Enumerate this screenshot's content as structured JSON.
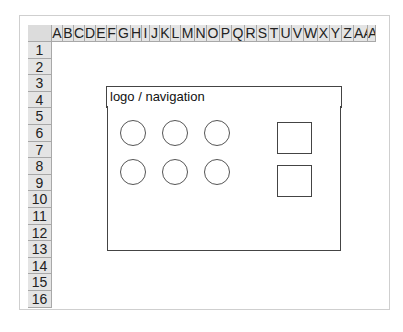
{
  "spreadsheet": {
    "columns": [
      "A",
      "B",
      "C",
      "D",
      "E",
      "F",
      "G",
      "H",
      "I",
      "J",
      "K",
      "L",
      "M",
      "N",
      "O",
      "P",
      "Q",
      "R",
      "S",
      "T",
      "U",
      "V",
      "W",
      "X",
      "Y",
      "Z",
      "AA",
      "AB"
    ],
    "column_widths": [
      11,
      11,
      11,
      11,
      11,
      10,
      14,
      11,
      8,
      10,
      11,
      10,
      14,
      12,
      13,
      12,
      13,
      12,
      12,
      11,
      12,
      12,
      14,
      12,
      12,
      12,
      14,
      8
    ],
    "rows": [
      "1",
      "2",
      "3",
      "4",
      "5",
      "6",
      "7",
      "8",
      "9",
      "10",
      "11",
      "12",
      "13",
      "14",
      "15",
      "16"
    ]
  },
  "wireframe": {
    "header_label": "logo  /  navigation",
    "circles": [
      {
        "x": 120,
        "y": 120
      },
      {
        "x": 162,
        "y": 120
      },
      {
        "x": 204,
        "y": 120
      },
      {
        "x": 120,
        "y": 159
      },
      {
        "x": 162,
        "y": 159
      },
      {
        "x": 204,
        "y": 159
      }
    ],
    "squares": [
      {
        "x": 277,
        "y": 122
      },
      {
        "x": 277,
        "y": 165
      }
    ]
  }
}
